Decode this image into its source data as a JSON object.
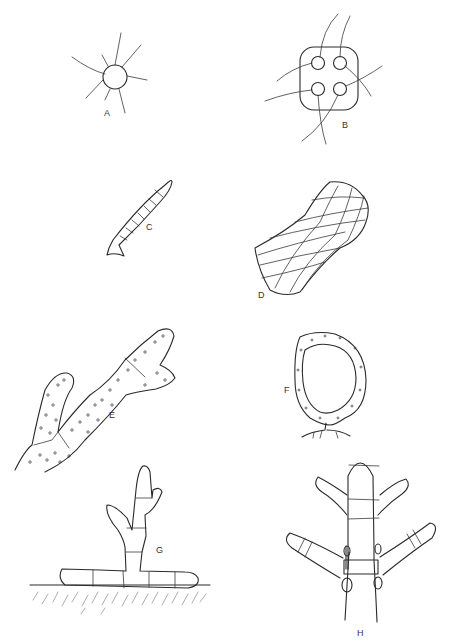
{
  "figure": {
    "panels": [
      {
        "id": "A",
        "label": "A",
        "description": "single cell with radiating flagella/hairs"
      },
      {
        "id": "B",
        "label": "B",
        "description": "four-celled colony in gelatinous matrix with flagella"
      },
      {
        "id": "C",
        "label": "C",
        "description": "unbranched uniseriate filament with holdfast"
      },
      {
        "id": "D",
        "label": "D",
        "description": "flat sheet-like parenchymatous thallus"
      },
      {
        "id": "E",
        "label": "E",
        "description": "branched multinucleate siphonous thallus"
      },
      {
        "id": "F",
        "label": "F",
        "description": "hollow vesicle-like thallus with rhizoids"
      },
      {
        "id": "G",
        "label": "G",
        "description": "heterotrichous filament with prostrate and erect systems"
      },
      {
        "id": "H",
        "label": "H",
        "description": "branched filament with whorled laterals and nodes"
      }
    ],
    "colors": {
      "stroke": "#2a2a2a",
      "background": "#ffffff",
      "hatch": "#8a8a8a"
    }
  }
}
